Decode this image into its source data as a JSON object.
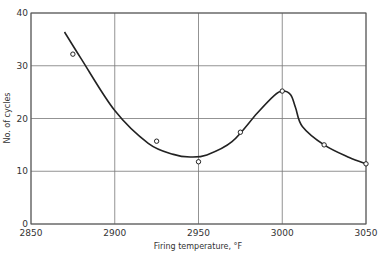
{
  "chart_data": {
    "type": "scatter",
    "title": "",
    "xlabel": "Firing temperature, °F",
    "ylabel": "No. of cycles",
    "xlim": [
      2850,
      3050
    ],
    "ylim": [
      0,
      40
    ],
    "x_ticks": [
      2850,
      2900,
      2950,
      3000,
      3050
    ],
    "y_ticks": [
      0,
      10,
      20,
      30,
      40
    ],
    "x_tick_labels": [
      "2850",
      "2900",
      "2950",
      "3000",
      "3050"
    ],
    "y_tick_labels": [
      "0",
      "10",
      "20",
      "30",
      "40"
    ],
    "grid": true,
    "legend": null,
    "series": [
      {
        "name": "Measured",
        "marker": "open-circle",
        "x": [
          2875,
          2925,
          2950,
          2975,
          3000,
          3025,
          3050
        ],
        "y": [
          32.2,
          15.7,
          11.8,
          17.4,
          25.2,
          15.0,
          11.4
        ]
      },
      {
        "name": "Fitted curve",
        "style": "smooth-line",
        "x": [
          2870,
          2880,
          2900,
          2920,
          2935,
          2945,
          2955,
          2970,
          2985,
          2995,
          3000,
          3005,
          3008,
          3012,
          3025,
          3040,
          3050
        ],
        "y": [
          36.4,
          31.3,
          21.5,
          15.3,
          13.2,
          12.7,
          13.1,
          15.6,
          21.0,
          24.3,
          25.2,
          24.5,
          22.0,
          18.5,
          15.0,
          12.6,
          11.4
        ]
      }
    ]
  }
}
